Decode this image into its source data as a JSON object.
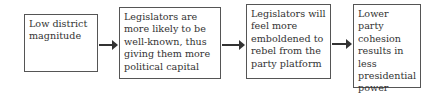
{
  "diagram": {
    "type": "flowchart",
    "direction": "left-to-right",
    "nodes": [
      {
        "id": "n1",
        "text": "Low district magnitude"
      },
      {
        "id": "n2",
        "text": "Legislators are more likely to be well-known, thus giving them more political capital"
      },
      {
        "id": "n3",
        "text": "Legislators will feel more emboldened to rebel from the party platform"
      },
      {
        "id": "n4",
        "text": "Lower party cohesion results in less presidential power"
      }
    ],
    "edges": [
      {
        "from": "n1",
        "to": "n2"
      },
      {
        "from": "n2",
        "to": "n3"
      },
      {
        "from": "n3",
        "to": "n4"
      }
    ]
  }
}
